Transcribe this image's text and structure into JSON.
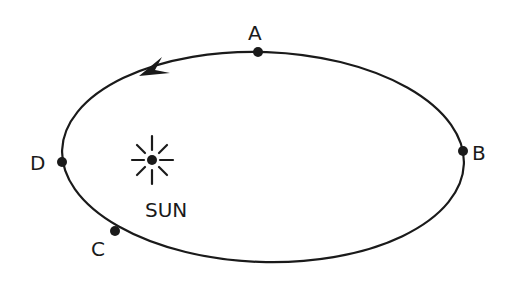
{
  "diagram": {
    "type": "orbit",
    "colors": {
      "stroke": "#1a1a1a",
      "background": "#ffffff"
    },
    "orbit": {
      "shape": "ellipse",
      "direction": "counterclockwise"
    },
    "sun": {
      "label": "SUN"
    },
    "points": [
      {
        "id": "A",
        "label": "A"
      },
      {
        "id": "B",
        "label": "B"
      },
      {
        "id": "C",
        "label": "C"
      },
      {
        "id": "D",
        "label": "D"
      }
    ]
  }
}
